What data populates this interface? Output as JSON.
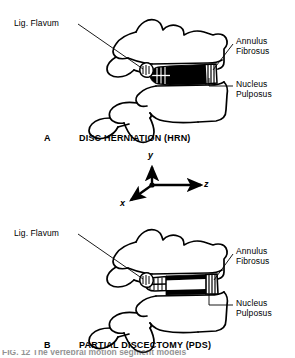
{
  "figure": {
    "panels": [
      {
        "letter": "A",
        "caption": "DISC HERNIATION (HRN)",
        "labels": {
          "lig_flavum": "Lig. Flavum",
          "annulus_fibrosus": "Annulus\nFibrosus",
          "nucleus_pulposus": "Nucleus\nPulposus"
        }
      },
      {
        "letter": "B",
        "caption": "PARTIAL DISCECTOMY (PDS)",
        "labels": {
          "lig_flavum": "Lig. Flavum",
          "annulus_fibrosus": "Annulus\nFibrosus",
          "nucleus_pulposus": "Nucleus\nPulposus"
        }
      }
    ],
    "axes": {
      "y": "y",
      "x": "x",
      "z": "z"
    },
    "bottom_cropped_caption": "FIG. 12  The vertebral motion segment models",
    "colors": {
      "ink": "#000000",
      "background": "#ffffff"
    }
  }
}
